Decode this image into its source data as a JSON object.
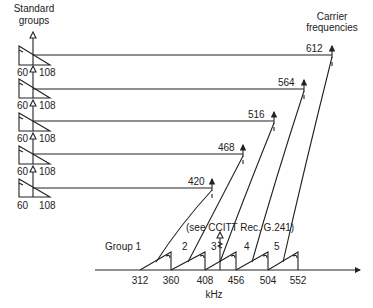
{
  "titles": {
    "standard_groups_line1": "Standard",
    "standard_groups_line2": "groups",
    "carrier_line1": "Carrier",
    "carrier_line2": "frequencies",
    "axis_unit": "kHz",
    "reference": "(see CCITT Rec. G.241)"
  },
  "standard_group": {
    "low": "60",
    "high": "108"
  },
  "rows": [
    {
      "carrier": "612",
      "group": "5"
    },
    {
      "carrier": "564",
      "group": "4"
    },
    {
      "carrier": "516",
      "group": "3"
    },
    {
      "carrier": "468",
      "group": "2"
    },
    {
      "carrier": "420",
      "group": "Group 1"
    }
  ],
  "axis_ticks": [
    "312",
    "360",
    "408",
    "456",
    "504",
    "552"
  ],
  "group_labels": [
    "Group 1",
    "2",
    "3",
    "4",
    "5"
  ],
  "colors": {
    "ink": "#222222",
    "background": "#ffffff"
  }
}
